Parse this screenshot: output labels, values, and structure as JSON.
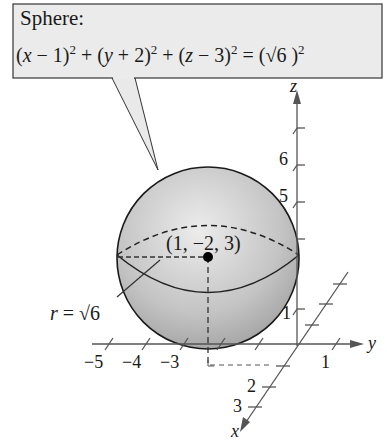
{
  "callout": {
    "title": "Sphere:",
    "equation_parts": {
      "t1": "(",
      "x": "x",
      "t2": " − 1)",
      "e1": "2",
      "t3": " + (",
      "y": "y",
      "t4": " + 2)",
      "e2": "2",
      "t5": " + (",
      "z": "z",
      "t6": " − 3)",
      "e3": "2",
      "t7": " = (√6 )",
      "e4": "2"
    },
    "equation": "(x − 1)^2 + (y + 2)^2 + (z − 3)^2 = (√6)^2"
  },
  "sphere": {
    "center_label": "(1, −2, 3)",
    "radius_label": "r = √6",
    "fill_color": "#bdbdbd",
    "outline_color": "#1a1a1a"
  },
  "axes": {
    "z": {
      "label": "z",
      "ticks": [
        "1",
        "5",
        "6"
      ]
    },
    "y": {
      "label": "y",
      "ticks": [
        "−5",
        "−4",
        "−3",
        "1"
      ]
    },
    "x": {
      "label": "x",
      "ticks": [
        "2",
        "3"
      ]
    },
    "color": "#555555"
  }
}
